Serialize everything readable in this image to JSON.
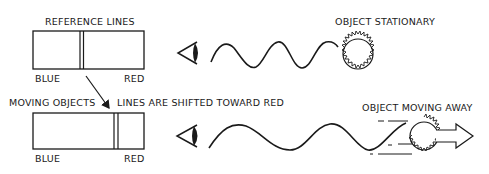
{
  "diagram": {
    "top_panel": {
      "spectrum_title": "REFERENCE LINES",
      "left_label": "BLUE",
      "right_label": "RED",
      "object_label": "OBJECT STATIONARY",
      "observer_icon": "eye-icon",
      "source_icon": "sun-icon"
    },
    "bottom_panel": {
      "spectrum_title_left": "MOVING OBJECTS",
      "spectrum_title_right": "LINES ARE SHIFTED TOWARD RED",
      "left_label": "BLUE",
      "right_label": "RED",
      "object_label": "OBJECT MOVING AWAY",
      "observer_icon": "eye-icon",
      "source_icon": "sun-icon",
      "motion_icon": "arrow-right-icon"
    },
    "colors": {
      "ink": "#1a1a1a",
      "background": "#ffffff"
    }
  }
}
